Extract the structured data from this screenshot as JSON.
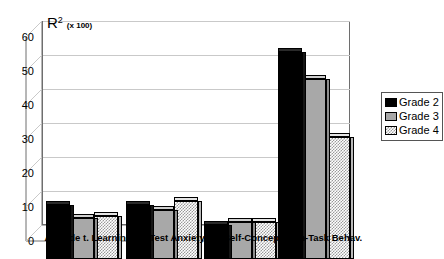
{
  "chart_data": {
    "type": "bar",
    "title_main": "R",
    "title_sup": "2",
    "title_unit": "(x 100)",
    "xlabel": "",
    "ylabel": "",
    "ylim": [
      0,
      60
    ],
    "yticks": [
      60,
      50,
      40,
      30,
      20,
      10,
      0
    ],
    "grid": true,
    "legend_position": "right",
    "three_d": true,
    "categories": [
      "Attitude t. Learning",
      "Test Anxiety",
      "Self-Concept",
      "On-Task Behav."
    ],
    "series": [
      {
        "name": "Grade 2",
        "color": "#000000",
        "values": [
          16,
          16,
          10,
          61
        ]
      },
      {
        "name": "Grade 3",
        "color": "#a8a8a8",
        "values": [
          12,
          14.5,
          11,
          53
        ]
      },
      {
        "name": "Grade 4",
        "color": "#dcdcdc",
        "values": [
          12.5,
          17,
          11,
          36
        ]
      }
    ]
  },
  "legend": {
    "items": [
      {
        "label": "Grade 2"
      },
      {
        "label": "Grade 3"
      },
      {
        "label": "Grade 4"
      }
    ]
  }
}
